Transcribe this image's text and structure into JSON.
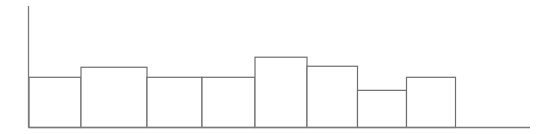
{
  "chart_data": {
    "type": "bar",
    "title": "",
    "xlabel": "",
    "ylabel": "",
    "grid": false,
    "legend": null,
    "bar_style": {
      "fill": "#ffffff",
      "stroke": "#6e6e6e"
    },
    "axis_color": "#7a7a7a",
    "categories": [
      "1",
      "2",
      "3",
      "4",
      "5",
      "6",
      "7",
      "8"
    ],
    "bar_edges_px": [
      29,
      81,
      147,
      202,
      255,
      307,
      357.5,
      406.5,
      455.5
    ],
    "values": [
      50,
      60,
      50,
      50,
      70,
      61,
      37,
      50
    ],
    "ylim": [
      0,
      121
    ],
    "plot": {
      "x0": 28.5,
      "x1": 530,
      "y_base": 127.5,
      "y_top": 6
    }
  }
}
